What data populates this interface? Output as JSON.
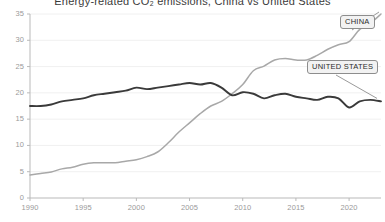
{
  "chart_data": {
    "type": "line",
    "title": "Energy-related CO₂ emissions, China vs United States",
    "subtitle": "",
    "xlabel": "",
    "ylabel": "",
    "xlim": [
      1990,
      2023
    ],
    "ylim": [
      0,
      35
    ],
    "xticks": [
      1990,
      1995,
      2000,
      2005,
      2010,
      2015,
      2020
    ],
    "xticklabels": [
      "1990",
      "1995",
      "2000",
      "2005",
      "2010",
      "2015",
      "2020"
    ],
    "yticks": [
      0,
      5,
      10,
      15,
      20,
      25,
      30,
      35
    ],
    "yticklabels": [
      "0",
      "5",
      "10",
      "15",
      "20",
      "25",
      "30",
      "35"
    ],
    "grid": "horizontal-faint",
    "legend_position": "inline-callout-labels",
    "x": [
      1990,
      1991,
      1992,
      1993,
      1994,
      1995,
      1996,
      1997,
      1998,
      1999,
      2000,
      2001,
      2002,
      2003,
      2004,
      2005,
      2006,
      2007,
      2008,
      2009,
      2010,
      2011,
      2012,
      2013,
      2014,
      2015,
      2016,
      2017,
      2018,
      2019,
      2020,
      2021,
      2022,
      2023
    ],
    "series": [
      {
        "name": "CHINA",
        "color": "#a8a8a8",
        "label": "CHINA",
        "values": [
          1.5,
          1.6,
          1.7,
          1.9,
          2.0,
          2.2,
          2.3,
          2.3,
          2.3,
          2.4,
          2.5,
          2.7,
          3.0,
          3.6,
          4.3,
          4.9,
          5.5,
          6.0,
          6.3,
          6.8,
          7.4,
          8.3,
          8.6,
          9.0,
          9.1,
          9.0,
          9.0,
          9.3,
          9.7,
          10.0,
          10.2,
          11.0,
          11.4,
          12.0
        ]
      },
      {
        "name": "UNITED STATES",
        "color": "#3a3a3a",
        "label": "UNITED STATES",
        "values": [
          6.0,
          6.0,
          6.1,
          6.3,
          6.4,
          6.5,
          6.7,
          6.8,
          6.9,
          7.0,
          7.2,
          7.1,
          7.2,
          7.3,
          7.4,
          7.5,
          7.4,
          7.5,
          7.2,
          6.7,
          6.9,
          6.8,
          6.5,
          6.7,
          6.8,
          6.6,
          6.5,
          6.4,
          6.6,
          6.5,
          5.9,
          6.3,
          6.4,
          6.3
        ]
      }
    ],
    "annotations": [
      {
        "name": "china-callout",
        "text": "CHINA",
        "points_to_series": "CHINA"
      },
      {
        "name": "united-states-callout",
        "text": "UNITED STATES",
        "points_to_series": "UNITED STATES"
      }
    ]
  }
}
